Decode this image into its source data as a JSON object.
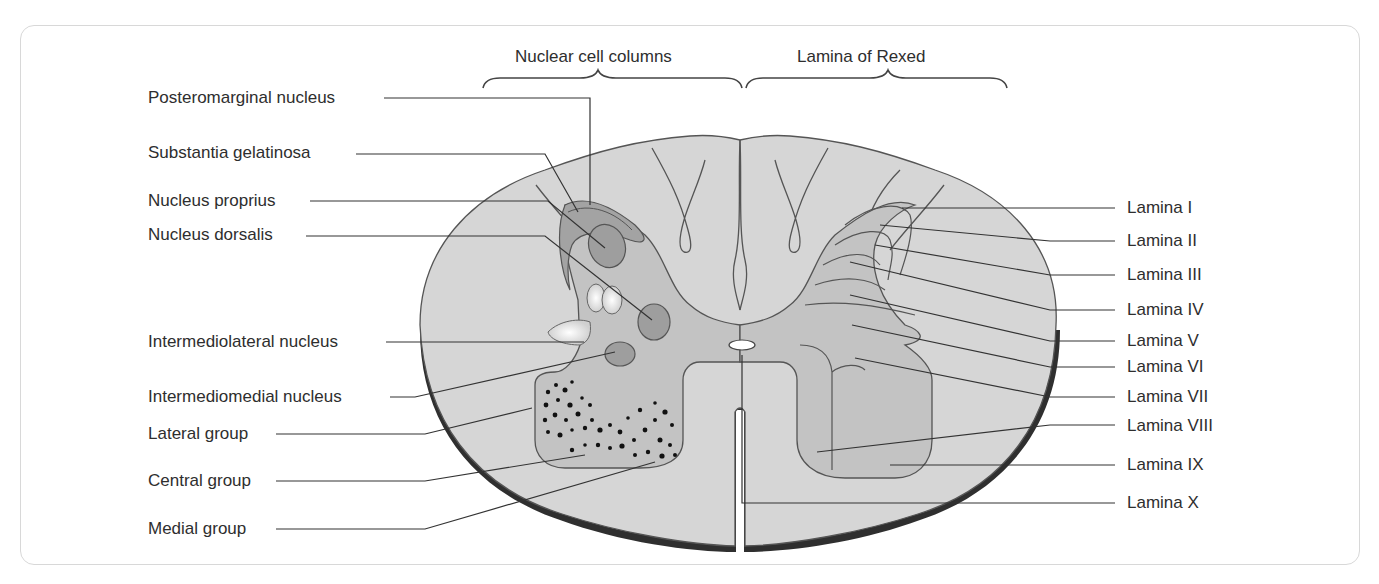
{
  "diagram": {
    "colors": {
      "white_matter": "#d6d6d6",
      "grey_matter": "#c3c3c3",
      "dark_nucleus": "#9e9e9e",
      "outline": "#555555",
      "pia_edge": "#2f2f2f",
      "frame_border": "#d8d8d8"
    },
    "headers": {
      "left": "Nuclear cell columns",
      "right": "Lamina of Rexed"
    },
    "left_labels": [
      {
        "text": "Posteromarginal nucleus"
      },
      {
        "text": "Substantia gelatinosa"
      },
      {
        "text": "Nucleus proprius"
      },
      {
        "text": "Nucleus dorsalis"
      },
      {
        "text": "Intermediolateral nucleus"
      },
      {
        "text": "Intermediomedial nucleus"
      },
      {
        "text": "Lateral group"
      },
      {
        "text": "Central group"
      },
      {
        "text": "Medial group"
      }
    ],
    "right_labels": [
      {
        "text": "Lamina I"
      },
      {
        "text": "Lamina II"
      },
      {
        "text": "Lamina III"
      },
      {
        "text": "Lamina IV"
      },
      {
        "text": "Lamina V"
      },
      {
        "text": "Lamina VI"
      },
      {
        "text": "Lamina VII"
      },
      {
        "text": "Lamina VIII"
      },
      {
        "text": "Lamina IX"
      },
      {
        "text": "Lamina X"
      }
    ]
  }
}
